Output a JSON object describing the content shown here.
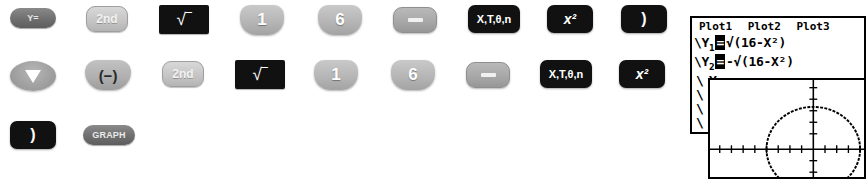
{
  "screen": {
    "width": 863,
    "height": 179,
    "background": "#ffffff"
  },
  "keystroke_sequence": {
    "rows": [
      {
        "row_index": 1,
        "keys": [
          {
            "name": "y-equals-key",
            "label": "Y=",
            "style": "pill",
            "x": 10,
            "y": 8,
            "w": 46,
            "h": 20
          },
          {
            "name": "second-key",
            "label": "2nd",
            "style": "second",
            "x": 86,
            "y": 6,
            "w": 42,
            "h": 26
          },
          {
            "name": "sqrt-key",
            "label": "√‾",
            "style": "black-rect",
            "x": 159,
            "y": 5,
            "w": 50,
            "h": 29
          },
          {
            "name": "one-key",
            "label": "1",
            "style": "number",
            "x": 240,
            "y": 5,
            "w": 44,
            "h": 30
          },
          {
            "name": "six-key",
            "label": "6",
            "style": "number",
            "x": 318,
            "y": 5,
            "w": 44,
            "h": 30
          },
          {
            "name": "minus-key",
            "label": "−",
            "style": "operator",
            "x": 393,
            "y": 7,
            "w": 44,
            "h": 26
          },
          {
            "name": "x-t-theta-n-key",
            "label": "X,T,θ,n",
            "style": "black",
            "x": 468,
            "y": 5,
            "w": 52,
            "h": 28
          },
          {
            "name": "x-squared-key",
            "label": "x²",
            "style": "black",
            "x": 547,
            "y": 5,
            "w": 46,
            "h": 28
          },
          {
            "name": "close-paren-key",
            "label": ")",
            "style": "black",
            "x": 621,
            "y": 5,
            "w": 46,
            "h": 28
          }
        ]
      },
      {
        "row_index": 2,
        "keys": [
          {
            "name": "down-arrow-key",
            "label": "▼",
            "style": "arrow",
            "x": 10,
            "y": 61,
            "w": 46,
            "h": 30
          },
          {
            "name": "negate-key",
            "label": "(−)",
            "style": "negate",
            "x": 85,
            "y": 60,
            "w": 46,
            "h": 30
          },
          {
            "name": "second-key-2",
            "label": "2nd",
            "style": "second",
            "x": 162,
            "y": 61,
            "w": 42,
            "h": 26
          },
          {
            "name": "sqrt-key-2",
            "label": "√‾",
            "style": "black-rect",
            "x": 235,
            "y": 60,
            "w": 50,
            "h": 29
          },
          {
            "name": "one-key-2",
            "label": "1",
            "style": "number",
            "x": 314,
            "y": 60,
            "w": 44,
            "h": 30
          },
          {
            "name": "six-key-2",
            "label": "6",
            "style": "number",
            "x": 391,
            "y": 60,
            "w": 44,
            "h": 30
          },
          {
            "name": "minus-key-2",
            "label": "−",
            "style": "operator",
            "x": 466,
            "y": 62,
            "w": 44,
            "h": 26
          },
          {
            "name": "x-t-theta-n-key-2",
            "label": "X,T,θ,n",
            "style": "black",
            "x": 540,
            "y": 60,
            "w": 52,
            "h": 28
          },
          {
            "name": "x-squared-key-2",
            "label": "x²",
            "style": "black",
            "x": 619,
            "y": 60,
            "w": 46,
            "h": 28
          }
        ]
      },
      {
        "row_index": 3,
        "keys": [
          {
            "name": "close-paren-key-2",
            "label": ")",
            "style": "black",
            "x": 10,
            "y": 121,
            "w": 46,
            "h": 28
          },
          {
            "name": "graph-key",
            "label": "GRAPH",
            "style": "pill",
            "x": 83,
            "y": 125,
            "w": 52,
            "h": 20
          }
        ]
      }
    ]
  },
  "y_editor_screen": {
    "name": "y-equals-editor-screen",
    "plots": [
      "Plot1",
      "Plot2",
      "Plot3"
    ],
    "functions": [
      {
        "slot": "\\Y",
        "index": "1",
        "equals": "=",
        "expression": "√(16-X²)"
      },
      {
        "slot": "\\Y",
        "index": "2",
        "equals": "=",
        "expression": "-√(16-X²)"
      }
    ],
    "empty_slot_marks": [
      "\\",
      "\\",
      "\\",
      "\\",
      "\\",
      "\\"
    ]
  },
  "graph_screen": {
    "name": "graph-screen",
    "description": "circle of radius 4 centered at origin drawn as two semicircles",
    "curve": {
      "type": "circle",
      "radius": 4,
      "center_x": 0,
      "center_y": 0
    },
    "axes": {
      "x_ticks": 20,
      "y_ticks": 12
    }
  },
  "colors": {
    "key_black": "#111111",
    "key_gray": "#b6b6b6",
    "key_dark_pill": "#6f6f6f",
    "screen_bg": "#ffffff",
    "screen_border": "#000000"
  }
}
